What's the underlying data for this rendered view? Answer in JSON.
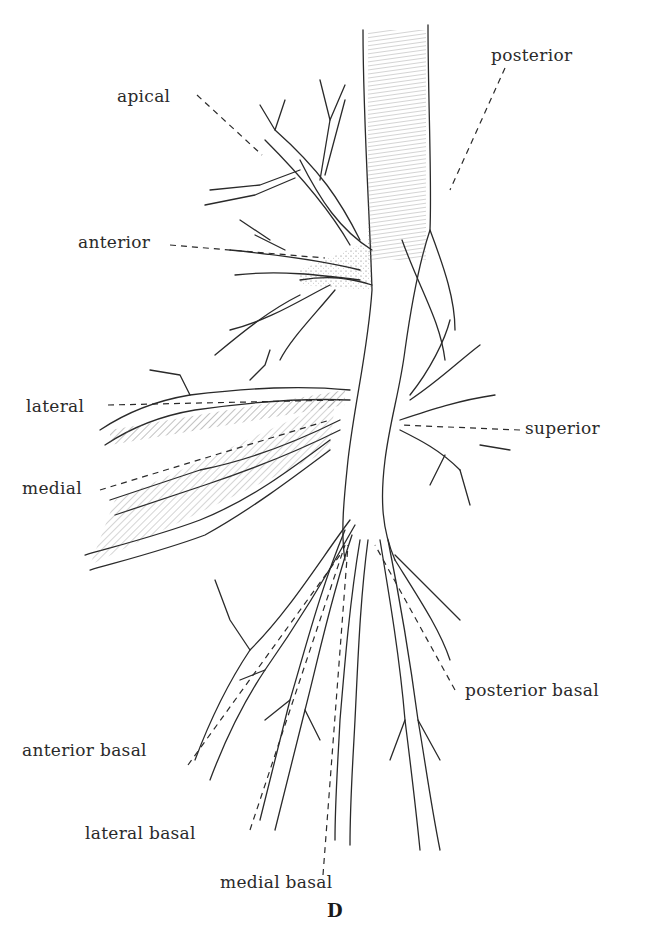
{
  "figure": {
    "panel_letter": "D",
    "labels": {
      "apical": "apical",
      "posterior": "posterior",
      "anterior": "anterior",
      "lateral": "lateral",
      "superior": "superior",
      "medial": "medial",
      "posterior_basal": "posterior basal",
      "anterior_basal": "anterior basal",
      "lateral_basal": "lateral basal",
      "medial_basal": "medial basal"
    }
  },
  "colors": {
    "ink": "#2a2a2a",
    "background": "#ffffff"
  }
}
